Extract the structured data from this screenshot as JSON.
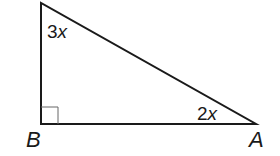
{
  "diagram": {
    "type": "right-triangle",
    "vertices": {
      "top": {
        "label": "",
        "x": 41,
        "y": 3
      },
      "B": {
        "label": "B",
        "x": 41,
        "y": 124
      },
      "A": {
        "label": "A",
        "x": 256,
        "y": 124
      }
    },
    "angle_labels": {
      "top": {
        "coef": "3",
        "var": "x"
      },
      "A": {
        "coef": "2",
        "var": "x"
      }
    },
    "right_angle_at": "B",
    "colors": {
      "stroke": "#1a1a1a",
      "box": "#555555",
      "background": "#ffffff"
    }
  }
}
